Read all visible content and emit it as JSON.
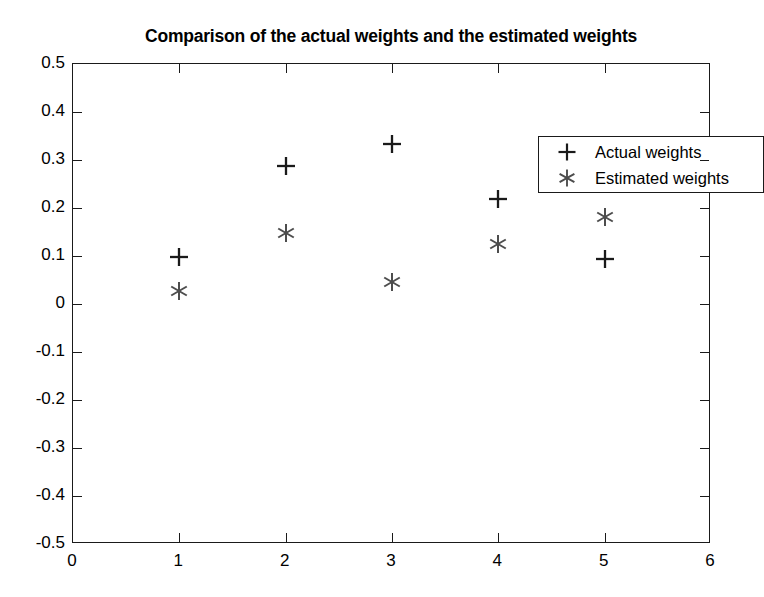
{
  "chart_data": {
    "type": "scatter",
    "title": "Comparison of the actual weights and the estimated weights",
    "xlabel": "",
    "ylabel": "",
    "xlim": [
      0,
      6
    ],
    "ylim": [
      -0.5,
      0.5
    ],
    "xticks": [
      "0",
      "1",
      "2",
      "3",
      "4",
      "5",
      "6"
    ],
    "xtick_values": [
      0,
      1,
      2,
      3,
      4,
      5,
      6
    ],
    "yticks": [
      "0.5",
      "0.4",
      "0.3",
      "0.2",
      "0.1",
      "0",
      "-0.1",
      "-0.2",
      "-0.3",
      "-0.4",
      "-0.5"
    ],
    "ytick_values": [
      0.5,
      0.4,
      0.3,
      0.2,
      0.1,
      0,
      -0.1,
      -0.2,
      -0.3,
      -0.4,
      -0.5
    ],
    "grid": false,
    "legend_position": "top-right",
    "x": [
      1,
      2,
      3,
      4,
      5
    ],
    "series": [
      {
        "name": "Actual weights",
        "marker": "plus",
        "color": "#1a1a1a",
        "values": [
          0.097,
          0.288,
          0.334,
          0.218,
          0.093
        ]
      },
      {
        "name": "Estimated weights",
        "marker": "asterisk",
        "color": "#4d4d4d",
        "values": [
          0.027,
          0.148,
          0.046,
          0.125,
          0.181
        ]
      }
    ]
  },
  "legend": {
    "entries": [
      {
        "symbol": "plus-marker-icon",
        "label": "Actual weights"
      },
      {
        "symbol": "asterisk-marker-icon",
        "label": "Estimated weights"
      }
    ]
  },
  "colors": {
    "axis": "#1a1a1a",
    "background": "#ffffff",
    "text": "#000000",
    "actual_marker": "#1a1a1a",
    "estimated_marker": "#4d4d4d"
  }
}
